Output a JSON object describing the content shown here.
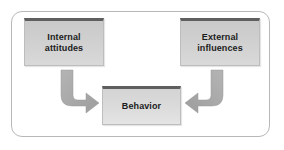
{
  "figure": {
    "frame": {
      "border_color": "#b8b8b8",
      "background": "#ffffff"
    }
  },
  "nodes": [
    {
      "id": "internal-attitudes",
      "label": "Internal\nattitudes",
      "line1": "Internal",
      "line2": "attitudes",
      "position": "top-left",
      "fill_color": "#cfcfcf",
      "top_bar_color": "#5f5f5f",
      "text_color": "#1c1c1c"
    },
    {
      "id": "external-influences",
      "label": "External\ninfluences",
      "line1": "External",
      "line2": "influences",
      "position": "top-right",
      "fill_color": "#cfcfcf",
      "top_bar_color": "#5f5f5f",
      "text_color": "#1c1c1c"
    },
    {
      "id": "behavior",
      "label": "Behavior",
      "line1": "Behavior",
      "line2": "",
      "position": "center-bottom",
      "fill_color": "#dadada",
      "top_bar_color": "#5f5f5f",
      "text_color": "#1c1c1c"
    }
  ],
  "arrows": [
    {
      "id": "arrow-internal-to-behavior",
      "from": "internal-attitudes",
      "to": "behavior",
      "shape": "elbow-down-right",
      "color": "#a8a8a8"
    },
    {
      "id": "arrow-external-to-behavior",
      "from": "external-influences",
      "to": "behavior",
      "shape": "elbow-down-left",
      "color": "#a8a8a8"
    }
  ]
}
